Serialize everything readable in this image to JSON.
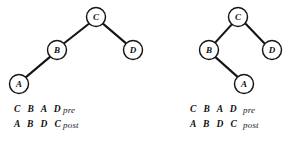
{
  "figure": {
    "title": "",
    "background_color": "#ffffff",
    "stroke_color": "#141414",
    "width": 296,
    "height": 153
  },
  "trees": [
    {
      "id": "tree-left",
      "description": "binary tree with A as left child of B",
      "nodes": [
        {
          "id": "C",
          "label": "C",
          "cx": 96,
          "cy": 17,
          "r": 9.5
        },
        {
          "id": "B",
          "label": "B",
          "cx": 57,
          "cy": 50,
          "r": 9.5
        },
        {
          "id": "D",
          "label": "D",
          "cx": 133,
          "cy": 50,
          "r": 9.5
        },
        {
          "id": "A",
          "label": "A",
          "cx": 19,
          "cy": 84,
          "r": 9.5
        }
      ],
      "edges": [
        {
          "from": "C",
          "to": "B"
        },
        {
          "from": "C",
          "to": "D"
        },
        {
          "from": "B",
          "to": "A"
        }
      ],
      "traversals": [
        {
          "sequence": "C B A D",
          "order": "pre"
        },
        {
          "sequence": "A B D C",
          "order": "post"
        }
      ]
    },
    {
      "id": "tree-right",
      "description": "binary tree with A as right child of B",
      "nodes": [
        {
          "id": "C",
          "label": "C",
          "cx": 90,
          "cy": 17,
          "r": 9.5
        },
        {
          "id": "B",
          "label": "B",
          "cx": 61,
          "cy": 50,
          "r": 9.5
        },
        {
          "id": "D",
          "label": "D",
          "cx": 124,
          "cy": 50,
          "r": 9.5
        },
        {
          "id": "A",
          "label": "A",
          "cx": 96,
          "cy": 84,
          "r": 9.5
        }
      ],
      "edges": [
        {
          "from": "C",
          "to": "B"
        },
        {
          "from": "C",
          "to": "D"
        },
        {
          "from": "B",
          "to": "A"
        }
      ],
      "traversals": [
        {
          "sequence": "C B A D",
          "order": "pre"
        },
        {
          "sequence": "A B D C",
          "order": "post"
        }
      ]
    }
  ]
}
